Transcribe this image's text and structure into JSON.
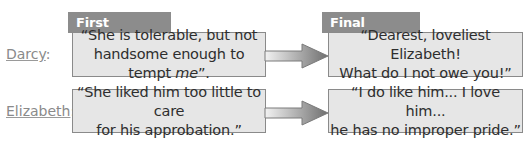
{
  "headers": {
    "first": "First Impression",
    "final": "Final Opinion"
  },
  "rows": [
    {
      "name": "Darcy",
      "colon": ":",
      "first": {
        "line1": "“She is tolerable, but not",
        "line2_pre": "handsome enough to tempt ",
        "line2_em": "me",
        "line2_post": "”."
      },
      "final": {
        "line1": "“Dearest, loveliest Elizabeth!",
        "line2": "What do I not owe you!”"
      }
    },
    {
      "name": "Elizabeth",
      "colon": ":",
      "first": {
        "line1": "“She liked him too little to care",
        "line2": "for his approbation.”"
      },
      "final": {
        "line1": "“I do like him...  I love him...",
        "line2": "he has no improper pride.”"
      }
    }
  ],
  "colors": {
    "tab": "#8c8c8c",
    "box_fill": "#e6e6e6",
    "box_border": "#8a8a8a",
    "label": "#8a8a8a"
  }
}
